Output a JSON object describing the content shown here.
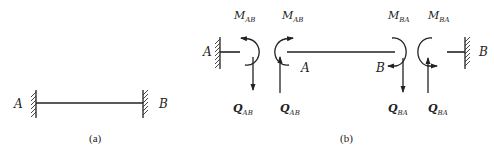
{
  "figure_a": {
    "caption": "(a)",
    "left_support_label": "A",
    "right_support_label": "B"
  },
  "figure_b": {
    "caption": "(b)",
    "left_support_label": "A",
    "right_support_label": "B",
    "beam_end_label_a": "A",
    "beam_end_label_b": "B",
    "moments": [
      {
        "main": "M",
        "sub": "AB"
      },
      {
        "main": "M",
        "sub": "AB"
      },
      {
        "main": "M",
        "sub": "BA"
      },
      {
        "main": "M",
        "sub": "BA"
      }
    ],
    "shears": [
      {
        "main": "Q",
        "sub": "AB"
      },
      {
        "main": "Q",
        "sub": "AB"
      },
      {
        "main": "Q",
        "sub": "BA"
      },
      {
        "main": "Q",
        "sub": "BA"
      }
    ]
  }
}
